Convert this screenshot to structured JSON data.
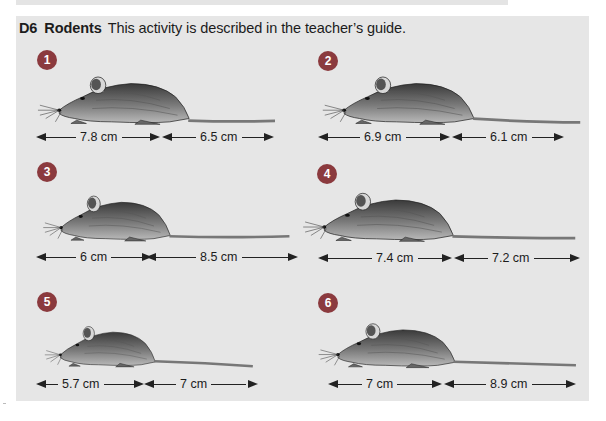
{
  "heading": {
    "code": "D6",
    "title": "Rodents",
    "description": "This activity is described in the teacher’s guide."
  },
  "colors": {
    "panel_background": "#e6e6e6",
    "badge": "#8b3a3e",
    "text": "#1c1c1c"
  },
  "rodents": [
    {
      "number": "1",
      "body_length": "7.8 cm",
      "tail_length": "6.5 cm"
    },
    {
      "number": "2",
      "body_length": "6.9 cm",
      "tail_length": "6.1 cm"
    },
    {
      "number": "3",
      "body_length": "6 cm",
      "tail_length": "8.5 cm"
    },
    {
      "number": "4",
      "body_length": "7.4 cm",
      "tail_length": "7.2 cm"
    },
    {
      "number": "5",
      "body_length": "5.7 cm",
      "tail_length": "7 cm"
    },
    {
      "number": "6",
      "body_length": "7 cm",
      "tail_length": "8.9 cm"
    }
  ]
}
